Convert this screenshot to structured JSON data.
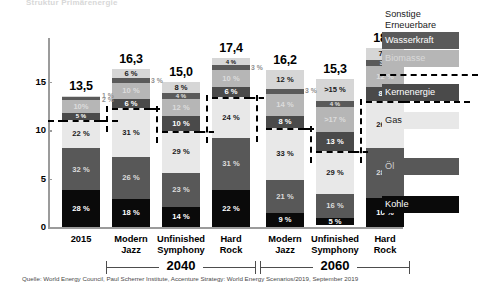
{
  "top_headline": "Struktur Primärenergie",
  "source_note": "Quelle: World Energy Council, Paul Scherrer Institute, Accenture Strategy: World Energy Scenarios/2019, September 2019",
  "axis": {
    "y_ticks": [
      "15",
      "10",
      "5",
      "0"
    ],
    "y_values": [
      15,
      10,
      5,
      0
    ],
    "y_max": 19.6
  },
  "groups": [
    {
      "label": "2040"
    },
    {
      "label": "2060"
    }
  ],
  "legend": {
    "items": [
      {
        "key": "sonstige",
        "label": "Sonstige\nErneuerbare",
        "color": "#d6d6d6",
        "text_color": "#1a1a1a"
      },
      {
        "key": "wasserkraft",
        "label": "Wasserkraft",
        "color": "#5a5a5a",
        "text_color": "#ffffff"
      },
      {
        "key": "biomasse",
        "label": "Biomasse",
        "color": "#b6b6b6",
        "text_color": "#d9d9d9"
      },
      {
        "key": "kernenergie",
        "label": "Kernenergie",
        "color": "#4a4a4a",
        "text_color": "#ffffff"
      },
      {
        "key": "gas",
        "label": "Gas",
        "color": "#e8e8e8",
        "text_color": "#1a1a1a"
      },
      {
        "key": "oel",
        "label": "Öl",
        "color": "#585858",
        "text_color": "#cccccc"
      },
      {
        "key": "kohle",
        "label": "Kohle",
        "color": "#0a0a0a",
        "text_color": "#ffffff"
      }
    ]
  },
  "chart_data": {
    "type": "bar",
    "subtype": "stacked-percent-with-total",
    "title": "Struktur Primärenergie",
    "xlabel": "",
    "ylabel": "",
    "ylim": [
      0,
      19.6
    ],
    "grid": false,
    "legend_position": "right",
    "categories": [
      "2015",
      "Modern\nJazz",
      "Unfinished\nSymphony",
      "Hard\nRock",
      "Modern\nJazz",
      "Unfinished\nSymphony",
      "Hard\nRock"
    ],
    "totals": [
      "13,5",
      "16,3",
      "15,0",
      "17,4",
      "16,2",
      "15,3",
      "18,5"
    ],
    "totals_numeric": [
      13.5,
      16.3,
      15.0,
      17.4,
      16.2,
      15.3,
      18.5
    ],
    "series": [
      {
        "name": "Sonstige Erneuerbare",
        "color": "#d6d6d6",
        "text_color": "#1a1a1a",
        "values": [
          1,
          6,
          8,
          4,
          12,
          15,
          7
        ],
        "labels": [
          "1 %",
          "6 %",
          "8 %",
          "4 %",
          "12 %",
          ">15 %",
          "7 %"
        ],
        "label_outside": [
          true,
          false,
          false,
          false,
          false,
          false,
          false
        ]
      },
      {
        "name": "Wasserkraft",
        "color": "#5a5a5a",
        "text_color": "#e0e0e0",
        "values": [
          2,
          3,
          4,
          3,
          3,
          4,
          3
        ],
        "labels": [
          "2 %",
          "3 %",
          "4 %",
          "3 %",
          "3 %",
          "4 %",
          "3 %"
        ],
        "label_outside": [
          true,
          true,
          false,
          true,
          true,
          false,
          false
        ]
      },
      {
        "name": "Biomasse",
        "color": "#b6b6b6",
        "text_color": "#dcdcdc",
        "values": [
          10,
          10,
          12,
          10,
          14,
          17,
          12
        ],
        "labels": [
          "10%",
          "10 %",
          "12 %",
          "10 %",
          "14 %",
          ">17 %",
          "12 %"
        ],
        "label_outside": [
          false,
          false,
          false,
          false,
          false,
          false,
          false
        ]
      },
      {
        "name": "Kernenergie",
        "color": "#4a4a4a",
        "text_color": "#ffffff",
        "values": [
          5,
          6,
          10,
          6,
          8,
          13,
          8
        ],
        "labels": [
          "5 %",
          "6 %",
          "10 %",
          "6 %",
          "8 %",
          "13 %",
          "8 %"
        ],
        "label_outside": [
          false,
          false,
          false,
          false,
          false,
          false,
          false
        ]
      },
      {
        "name": "Gas",
        "color": "#e8e8e8",
        "text_color": "#1a1a1a",
        "values": [
          22,
          31,
          29,
          24,
          33,
          29,
          26
        ],
        "labels": [
          "22 %",
          "31 %",
          "29 %",
          "24 %",
          "33 %",
          "29 %",
          "26 %"
        ],
        "label_outside": [
          false,
          false,
          false,
          false,
          false,
          false,
          false
        ]
      },
      {
        "name": "Öl",
        "color": "#585858",
        "text_color": "#dcdcdc",
        "values": [
          32,
          26,
          23,
          31,
          21,
          16,
          28
        ],
        "labels": [
          "32 %",
          "26 %",
          "23 %",
          "31 %",
          "21 %",
          "16 %",
          "28 %"
        ],
        "label_outside": [
          false,
          false,
          false,
          false,
          false,
          false,
          false
        ]
      },
      {
        "name": "Kohle",
        "color": "#0a0a0a",
        "text_color": "#ffffff",
        "values": [
          28,
          18,
          14,
          22,
          9,
          5,
          16
        ],
        "labels": [
          "28 %",
          "18 %",
          "14 %",
          "22 %",
          "9 %",
          "5 %",
          "16 %"
        ],
        "label_outside": [
          false,
          false,
          false,
          false,
          false,
          false,
          false
        ]
      }
    ]
  }
}
